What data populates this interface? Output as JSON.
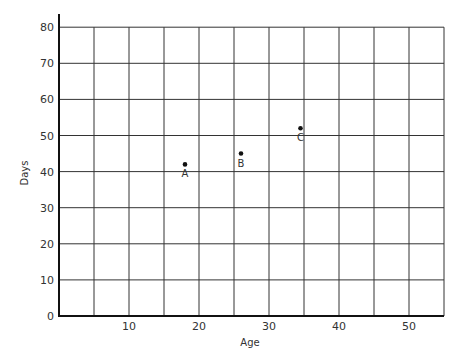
{
  "chart_data": {
    "type": "scatter",
    "title": "",
    "xlabel": "Age",
    "ylabel": "Days",
    "xlim": [
      0,
      55
    ],
    "ylim": [
      0,
      80
    ],
    "x_ticks": [
      10,
      20,
      30,
      40,
      50
    ],
    "y_ticks": [
      0,
      10,
      20,
      30,
      40,
      50,
      60,
      70,
      80
    ],
    "x_grid_step": 5,
    "y_grid_step": 10,
    "grid": true,
    "legend": null,
    "points": [
      {
        "label": "A",
        "x": 18,
        "y": 42
      },
      {
        "label": "B",
        "x": 26,
        "y": 45
      },
      {
        "label": "C",
        "x": 34.5,
        "y": 52
      }
    ]
  },
  "colors": {
    "grid": "#333333",
    "axis": "#111111",
    "points": "#111111",
    "background": "#ffffff"
  }
}
